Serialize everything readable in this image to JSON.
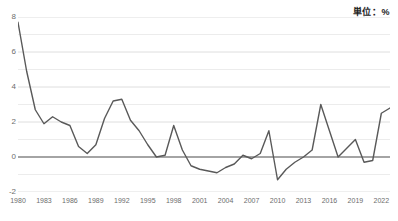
{
  "chart_data": {
    "type": "line",
    "title": "単位：%",
    "xlabel": "",
    "ylabel": "",
    "ylim": [
      -2,
      8
    ],
    "xlim": [
      1980,
      2023
    ],
    "grid": true,
    "legend": null,
    "y_ticks": [
      "8",
      "6",
      "4",
      "2",
      "0",
      "-2"
    ],
    "y_tick_values": [
      8,
      6,
      4,
      2,
      0,
      -2
    ],
    "y_minor_gridlines": [
      7,
      5,
      3,
      1,
      -1
    ],
    "x_ticks": [
      "1980",
      "1983",
      "1986",
      "1989",
      "1992",
      "1995",
      "1998",
      "2001",
      "2004",
      "2007",
      "2010",
      "2013",
      "2016",
      "2019",
      "2022"
    ],
    "x_tick_values": [
      1980,
      1983,
      1986,
      1989,
      1992,
      1995,
      1998,
      2001,
      2004,
      2007,
      2010,
      2013,
      2016,
      2019,
      2022
    ],
    "series": [
      {
        "name": "",
        "color": "#595959",
        "x": [
          1980,
          1981,
          1982,
          1983,
          1984,
          1985,
          1986,
          1987,
          1988,
          1989,
          1990,
          1991,
          1992,
          1993,
          1994,
          1995,
          1996,
          1997,
          1998,
          1999,
          2000,
          2001,
          2002,
          2003,
          2004,
          2005,
          2006,
          2007,
          2008,
          2009,
          2010,
          2011,
          2012,
          2013,
          2014,
          2015,
          2016,
          2017,
          2018,
          2019,
          2020,
          2021,
          2022,
          2023
        ],
        "values": [
          7.7,
          4.9,
          2.7,
          1.9,
          2.3,
          2.0,
          1.8,
          0.6,
          0.2,
          0.7,
          2.2,
          3.2,
          3.3,
          2.1,
          1.5,
          0.7,
          0.0,
          0.1,
          1.8,
          0.4,
          -0.5,
          -0.7,
          -0.8,
          -0.9,
          -0.6,
          -0.4,
          0.1,
          -0.1,
          0.2,
          1.5,
          -1.3,
          -0.7,
          -0.3,
          0.0,
          0.4,
          3.0,
          1.5,
          0.0,
          0.5,
          1.0,
          -0.3,
          -0.2,
          2.5,
          2.8
        ]
      }
    ],
    "zero_line_value": 0
  }
}
